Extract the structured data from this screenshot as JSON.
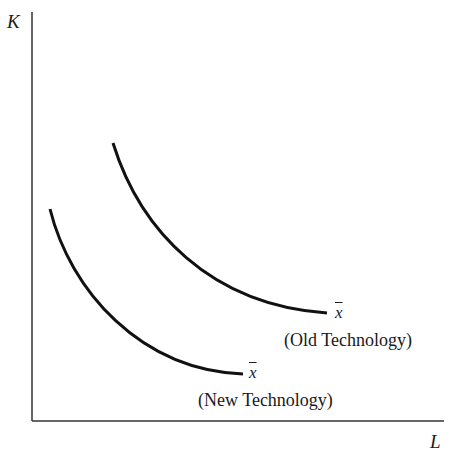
{
  "diagram": {
    "axes": {
      "y_label": "K",
      "x_label": "L"
    },
    "curves": [
      {
        "id": "old",
        "symbol": "x̄",
        "symbol_text": "x",
        "label": "(Old Technology)"
      },
      {
        "id": "new",
        "symbol": "x̄",
        "symbol_text": "x",
        "label": "(New Technology)"
      }
    ],
    "colors": {
      "line": "#111111",
      "background": "#ffffff"
    }
  }
}
